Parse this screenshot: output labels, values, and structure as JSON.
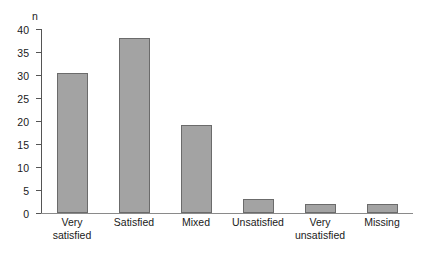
{
  "chart_data": {
    "type": "bar",
    "title": "",
    "subtitle": "",
    "xlabel": "",
    "ylabel": "n",
    "ylim": [
      0,
      40
    ],
    "yticks": [
      0,
      5,
      10,
      15,
      20,
      25,
      30,
      35,
      40
    ],
    "ytick_labels": [
      "0",
      "5",
      "10",
      "15",
      "20",
      "25",
      "30",
      "35",
      "40"
    ],
    "grid": false,
    "legend": false,
    "bar_fill_color": "#a3a3a3",
    "bar_edge_color": "#6b6b6b",
    "axis_color": "#555555",
    "categories": [
      "Very\nsatisfied",
      "Satisfied",
      "Mixed",
      "Unsatisfied",
      "Very\nunsatisfied",
      "Missing"
    ],
    "values": [
      30.5,
      38,
      19.2,
      3,
      2,
      2
    ]
  }
}
